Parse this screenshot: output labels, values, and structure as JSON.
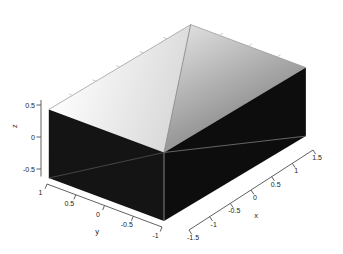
{
  "window": {
    "width": 343,
    "height": 254,
    "background": "#ffffff"
  },
  "chart_data": {
    "type": "surface",
    "title": "",
    "surface": {
      "shape": "box",
      "x_range": [
        -1.5,
        1.5
      ],
      "y_range": [
        -1,
        1
      ],
      "z_range": [
        -0.5,
        0.5
      ],
      "top_face_z": 0.5,
      "top_face_diagonal": {
        "from": [
          1.5,
          1,
          0.5
        ],
        "to": [
          -1.5,
          -1,
          0.5
        ]
      },
      "left_face_diagonal": {
        "from": [
          -1.5,
          1,
          -0.5
        ],
        "to": [
          -1.5,
          -1,
          0.5
        ]
      },
      "right_face_diagonal": {
        "from": [
          -1.5,
          -1,
          0.5
        ],
        "to": [
          1.5,
          -1,
          -0.5
        ]
      }
    },
    "xlabel": "x",
    "ylabel": "y",
    "zlabel": "z",
    "xlim": [
      -1.5,
      1.5
    ],
    "ylim": [
      -1,
      1
    ],
    "zlim": [
      -0.5,
      0.5
    ],
    "x_ticks": [
      -1.5,
      -1,
      -0.5,
      0,
      0.5,
      1,
      1.5
    ],
    "x_tick_labels": [
      "-1.5",
      "-1",
      "-0.5",
      "0",
      "0.5",
      "1",
      "1.5"
    ],
    "y_ticks": [
      1,
      0.5,
      0,
      -0.5,
      -1
    ],
    "y_tick_labels": [
      "1",
      "0.5",
      "0",
      "-0.5",
      "-1"
    ],
    "z_ticks": [
      0.5,
      0,
      -0.5
    ],
    "z_tick_labels": [
      "0.5",
      "0",
      "-0.5"
    ],
    "grid": false,
    "legend": null,
    "colors": {
      "background": "#ffffff",
      "top_face_left_light": "#fefefe",
      "top_face_left_shade": "#d6d6d6",
      "top_face_right_light": "#dedede",
      "top_face_right_shade": "#989898",
      "side_face_left": "#141414",
      "side_face_right": "#0d0d0d",
      "top_back_edge": "#a0a0a0",
      "top_facet_edge": "#8a8a8a",
      "left_face_edge": "#454545",
      "right_face_edge": "#6e6e6e",
      "front_vertical_edge": "#8f8f8f",
      "back_tick": "#bfbfbf",
      "axis": "#4f4f4f",
      "tick_text": "#222222"
    }
  }
}
